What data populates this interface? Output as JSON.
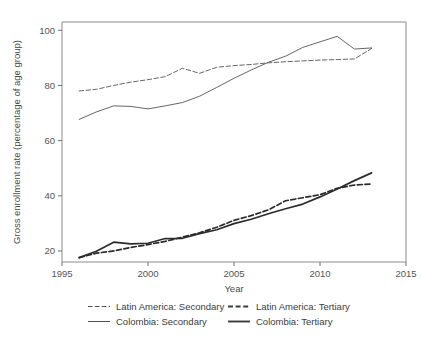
{
  "chart_data": {
    "type": "line",
    "title": "",
    "xlabel": "Year",
    "ylabel": "Gross enrollment rate (percentage of age group)",
    "xlim": [
      1995,
      2015
    ],
    "ylim": [
      16,
      103
    ],
    "xticks": [
      1995,
      2000,
      2005,
      2010,
      2015
    ],
    "xtick_labels": [
      "1995",
      "2000",
      "2005",
      "2010",
      "2015"
    ],
    "yticks": [
      20,
      40,
      60,
      80,
      100
    ],
    "ytick_labels": [
      "20",
      "40",
      "60",
      "80",
      "100"
    ],
    "grid": false,
    "legend_position": "bottom",
    "x": [
      1996,
      1997,
      1998,
      1999,
      2000,
      2001,
      2002,
      2003,
      2004,
      2005,
      2006,
      2007,
      2008,
      2009,
      2010,
      2011,
      2012,
      2013
    ],
    "series": [
      {
        "name": "Latin America: Secondary",
        "style": "dashed",
        "width": "thin",
        "color": "#555555",
        "values": [
          78.0,
          78.6,
          80.0,
          81.2,
          82.1,
          83.2,
          86.2,
          84.4,
          86.6,
          87.2,
          87.6,
          88.2,
          88.6,
          88.9,
          89.2,
          89.4,
          89.6,
          93.4
        ]
      },
      {
        "name": "Colombia: Secondary",
        "style": "solid",
        "width": "thin",
        "color": "#555555",
        "values": [
          67.7,
          70.4,
          72.6,
          72.4,
          71.5,
          72.6,
          73.8,
          76.1,
          79.3,
          82.6,
          85.6,
          88.4,
          90.6,
          93.8,
          95.8,
          97.8,
          93.2,
          93.6
        ]
      },
      {
        "name": "Latin America: Tertiary",
        "style": "dashed",
        "width": "thick",
        "color": "#2b2b2b",
        "values": [
          17.6,
          19.2,
          20.0,
          21.3,
          22.3,
          23.5,
          25.0,
          26.6,
          28.6,
          31.1,
          32.8,
          34.9,
          38.2,
          39.3,
          40.4,
          42.7,
          43.9,
          44.3
        ]
      },
      {
        "name": "Colombia: Tertiary",
        "style": "solid",
        "width": "thick",
        "color": "#2b2b2b",
        "values": [
          17.6,
          19.9,
          23.2,
          22.6,
          22.8,
          24.5,
          24.6,
          26.3,
          27.7,
          29.9,
          31.5,
          33.5,
          35.3,
          37.0,
          39.6,
          42.5,
          45.5,
          48.3
        ]
      }
    ]
  },
  "legend": {
    "entries": [
      {
        "label": "Latin America: Secondary",
        "style": "dashed",
        "width": "thin"
      },
      {
        "label": "Latin America: Tertiary",
        "style": "dashed",
        "width": "thick"
      },
      {
        "label": "Colombia: Secondary",
        "style": "solid",
        "width": "thin"
      },
      {
        "label": "Colombia: Tertiary",
        "style": "solid",
        "width": "thick"
      }
    ]
  }
}
